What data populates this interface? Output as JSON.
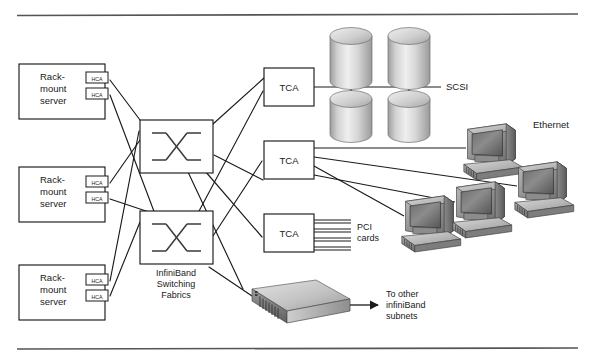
{
  "figure": {
    "rule_color": "#555555"
  },
  "servers": [
    {
      "id": "server-1",
      "line1": "Rack-",
      "line2": "mount",
      "line3": "server",
      "hca": [
        {
          "label": "HCA"
        },
        {
          "label": "HCA"
        }
      ]
    },
    {
      "id": "server-2",
      "line1": "Rack-",
      "line2": "mount",
      "line3": "server",
      "hca": [
        {
          "label": "HCA"
        },
        {
          "label": "HCA"
        }
      ]
    },
    {
      "id": "server-3",
      "line1": "Rack-",
      "line2": "mount",
      "line3": "server",
      "hca": [
        {
          "label": "HCA"
        },
        {
          "label": "HCA"
        }
      ]
    }
  ],
  "fabric": {
    "caption_line1": "InfiniBand",
    "caption_line2": "Switching",
    "caption_line3": "Fabrics",
    "switches": [
      {
        "id": "switch-top"
      },
      {
        "id": "switch-bottom"
      }
    ]
  },
  "tcas": [
    {
      "id": "tca-storage",
      "label": "TCA"
    },
    {
      "id": "tca-ethernet",
      "label": "TCA"
    },
    {
      "id": "tca-pci",
      "label": "TCA"
    }
  ],
  "storage": {
    "bus_label": "SCSI",
    "disk_count": 4
  },
  "pci": {
    "label_line1": "PCI",
    "label_line2": "cards",
    "card_count": 4
  },
  "ethernet": {
    "label": "Ethernet",
    "workstation_count": 4
  },
  "router": {
    "arrow_label_line1": "To other",
    "arrow_label_line2": "infiniBand",
    "arrow_label_line3": "subnets"
  },
  "colors": {
    "line": "#1a1a1a",
    "box_fill": "#ffffff",
    "text": "#1a1a1a",
    "metal_light": "#e8e8e8",
    "metal_mid": "#b8b8b8",
    "metal_dark": "#7a7a7a",
    "metal_darker": "#5a5a5a"
  }
}
